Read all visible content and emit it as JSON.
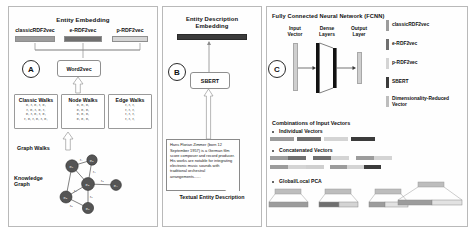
{
  "figure": {
    "panels": [
      "A",
      "B",
      "C"
    ]
  },
  "panelA": {
    "letter": "A",
    "title": "Entity Embedding",
    "columns": [
      {
        "label": "classicRDF2vec",
        "color": "#9c9c9c"
      },
      {
        "label": "e-RDF2vec",
        "color": "#6f6f6f"
      },
      {
        "label": "p-RDF2vec",
        "color": "#d4d4d4"
      }
    ],
    "model": "Word2vec",
    "walk_boxes": [
      {
        "header": "Classic Walks",
        "rows": [
          "e, r, e, r, e,",
          "r, e, r, e, r,",
          "e, r, e, r, e,",
          "r, e, r, e, r, e,"
        ]
      },
      {
        "header": "Node Walks",
        "rows": [
          "e, e, e,",
          "e, e, e,",
          "e, e, e,",
          "e, e, e,"
        ]
      },
      {
        "header": "Edge Walks",
        "rows": [
          "r, r, r,",
          "r, r, r,",
          "r, r, r,",
          "r, r, r,"
        ]
      }
    ],
    "walks_label": "Graph Walks",
    "graph_label": "Knowledge\nGraph",
    "graph_nodes": [
      "e1",
      "e2",
      "e3",
      "e4",
      "e5",
      "e6",
      "e7"
    ],
    "graph_edges": [
      "r1",
      "r2",
      "r3",
      "r4",
      "r5",
      "r6"
    ]
  },
  "panelB": {
    "letter": "B",
    "title": "Entity Description\nEmbedding",
    "embedding_color": "#3b3b3b",
    "model": "SBERT",
    "description_text": "Hans Florian Zimmer (born 12 September 1957) is a German film score composer and record producer. His works are notable for integrating electronic music sounds with traditional orchestral arrangements......",
    "caption": "Textual Entity Description"
  },
  "panelC": {
    "letter": "C",
    "title": "Fully Connected Neural Network (FCNN)",
    "nn_labels": [
      "Input\nVector",
      "Dense\nLayers",
      "Output\nLayer"
    ],
    "legend": [
      {
        "label": "classicRDF2vec",
        "color": "#9c9c9c"
      },
      {
        "label": "e-RDF2vec",
        "color": "#6f6f6f"
      },
      {
        "label": "p-RDF2vec",
        "color": "#d4d4d4"
      },
      {
        "label": "SBERT",
        "color": "#3b3b3b"
      },
      {
        "label": "Dimensionality-Reduced\nVector",
        "color": "#bdbdbd"
      }
    ],
    "combinations_title": "Combinations of Input Vectors",
    "groups": [
      {
        "label": "Individual Vectors"
      },
      {
        "label": "Concatenated Vectors"
      },
      {
        "label": "Global/Local PCA"
      }
    ]
  }
}
